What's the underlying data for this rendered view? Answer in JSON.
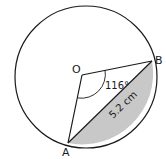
{
  "diagram": {
    "type": "circle-segment",
    "circle": {
      "cx": 86,
      "cy": 77,
      "r": 71
    },
    "points": {
      "O": {
        "label": "O",
        "x": 82,
        "y": 75
      },
      "A": {
        "label": "A",
        "x": 68,
        "y": 143
      },
      "B": {
        "label": "B",
        "x": 152,
        "y": 61
      }
    },
    "angle_label": "116°",
    "chord_label": "5.2 cm",
    "colors": {
      "stroke": "#1a1a1a",
      "shade": "#c8c8c8",
      "background": "#ffffff"
    }
  }
}
